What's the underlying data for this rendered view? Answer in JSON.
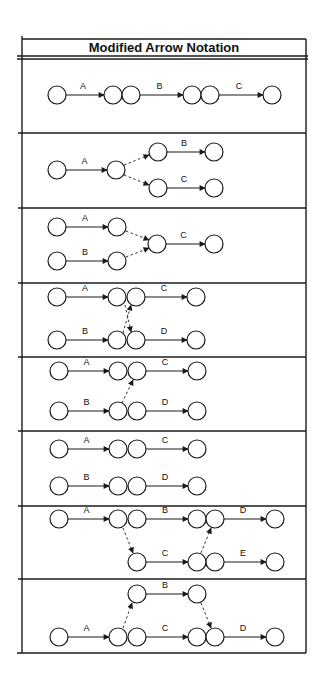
{
  "title": "Modified Arrow Notation",
  "colors": {
    "line": "#1a1a1a",
    "background": "#ffffff"
  },
  "layout": {
    "frame": {
      "left": 22,
      "right": 306,
      "top": 39,
      "bottom": 653,
      "double_line_y": [
        56,
        59
      ]
    },
    "dividers": [
      133,
      208,
      283,
      357,
      431,
      506,
      579
    ],
    "node_radius": 9
  },
  "sections": [
    {
      "name": "sequential-activities",
      "nodes": [
        [
          57,
          95
        ],
        [
          113,
          95
        ],
        [
          131,
          95
        ],
        [
          192,
          95
        ],
        [
          210,
          95
        ],
        [
          272,
          95
        ]
      ],
      "arrows": [
        {
          "from": [
            66,
            95
          ],
          "to": [
            104,
            95
          ],
          "label": "A",
          "type": "activity"
        },
        {
          "from": [
            140,
            95
          ],
          "to": [
            183,
            95
          ],
          "label": "B",
          "type": "activity"
        },
        {
          "from": [
            219,
            95
          ],
          "to": [
            263,
            95
          ],
          "label": "C",
          "type": "activity"
        }
      ]
    },
    {
      "name": "burst-dependency",
      "nodes": [
        [
          57,
          170
        ],
        [
          116,
          170
        ],
        [
          158,
          152
        ],
        [
          214,
          152
        ],
        [
          158,
          188
        ],
        [
          214,
          188
        ]
      ],
      "arrows": [
        {
          "from": [
            66,
            170
          ],
          "to": [
            107,
            170
          ],
          "label": "A",
          "type": "activity"
        },
        {
          "from": [
            124,
            165
          ],
          "to": [
            149,
            155
          ],
          "label": "",
          "type": "dummy"
        },
        {
          "from": [
            124,
            175
          ],
          "to": [
            149,
            185
          ],
          "label": "",
          "type": "dummy"
        },
        {
          "from": [
            167,
            152
          ],
          "to": [
            205,
            152
          ],
          "label": "B",
          "type": "activity"
        },
        {
          "from": [
            167,
            188
          ],
          "to": [
            205,
            188
          ],
          "label": "C",
          "type": "activity"
        }
      ]
    },
    {
      "name": "merge-dependency",
      "nodes": [
        [
          57,
          227
        ],
        [
          117,
          227
        ],
        [
          157,
          244
        ],
        [
          214,
          244
        ],
        [
          57,
          261
        ],
        [
          117,
          261
        ]
      ],
      "arrows": [
        {
          "from": [
            66,
            227
          ],
          "to": [
            108,
            227
          ],
          "label": "A",
          "type": "activity"
        },
        {
          "from": [
            66,
            261
          ],
          "to": [
            108,
            261
          ],
          "label": "B",
          "type": "activity"
        },
        {
          "from": [
            126,
            231
          ],
          "to": [
            149,
            240
          ],
          "label": "",
          "type": "dummy"
        },
        {
          "from": [
            126,
            257
          ],
          "to": [
            149,
            248
          ],
          "label": "",
          "type": "dummy"
        },
        {
          "from": [
            166,
            244
          ],
          "to": [
            205,
            244
          ],
          "label": "C",
          "type": "activity"
        }
      ]
    },
    {
      "name": "cross-dependency",
      "nodes": [
        [
          57,
          297
        ],
        [
          117,
          297
        ],
        [
          136,
          297
        ],
        [
          196,
          297
        ],
        [
          57,
          340
        ],
        [
          117,
          340
        ],
        [
          136,
          340
        ],
        [
          196,
          340
        ]
      ],
      "arrows": [
        {
          "from": [
            66,
            297
          ],
          "to": [
            108,
            297
          ],
          "label": "A",
          "type": "activity"
        },
        {
          "from": [
            145,
            297
          ],
          "to": [
            187,
            297
          ],
          "label": "C",
          "type": "activity"
        },
        {
          "from": [
            66,
            340
          ],
          "to": [
            108,
            340
          ],
          "label": "B",
          "type": "activity"
        },
        {
          "from": [
            145,
            340
          ],
          "to": [
            187,
            340
          ],
          "label": "D",
          "type": "activity"
        },
        {
          "from": [
            123,
            333
          ],
          "to": [
            131,
            305
          ],
          "label": "",
          "type": "dummy"
        },
        {
          "from": [
            125,
            305
          ],
          "to": [
            131,
            332
          ],
          "label": "",
          "type": "dummy"
        }
      ]
    },
    {
      "name": "single-cross-dependency",
      "nodes": [
        [
          59,
          371
        ],
        [
          118,
          371
        ],
        [
          137,
          371
        ],
        [
          197,
          371
        ],
        [
          59,
          411
        ],
        [
          118,
          411
        ],
        [
          137,
          411
        ],
        [
          197,
          411
        ]
      ],
      "arrows": [
        {
          "from": [
            68,
            371
          ],
          "to": [
            109,
            371
          ],
          "label": "A",
          "type": "activity"
        },
        {
          "from": [
            146,
            371
          ],
          "to": [
            188,
            371
          ],
          "label": "C",
          "type": "activity"
        },
        {
          "from": [
            68,
            411
          ],
          "to": [
            109,
            411
          ],
          "label": "B",
          "type": "activity"
        },
        {
          "from": [
            146,
            411
          ],
          "to": [
            188,
            411
          ],
          "label": "D",
          "type": "activity"
        },
        {
          "from": [
            122,
            403
          ],
          "to": [
            133,
            380
          ],
          "label": "",
          "type": "dummy"
        }
      ]
    },
    {
      "name": "independent-chains",
      "nodes": [
        [
          59,
          449
        ],
        [
          118,
          449
        ],
        [
          137,
          449
        ],
        [
          197,
          449
        ],
        [
          59,
          486
        ],
        [
          118,
          486
        ],
        [
          137,
          486
        ],
        [
          197,
          486
        ]
      ],
      "arrows": [
        {
          "from": [
            68,
            449
          ],
          "to": [
            109,
            449
          ],
          "label": "A",
          "type": "activity"
        },
        {
          "from": [
            146,
            449
          ],
          "to": [
            188,
            449
          ],
          "label": "C",
          "type": "activity"
        },
        {
          "from": [
            68,
            486
          ],
          "to": [
            109,
            486
          ],
          "label": "B",
          "type": "activity"
        },
        {
          "from": [
            146,
            486
          ],
          "to": [
            188,
            486
          ],
          "label": "D",
          "type": "activity"
        }
      ]
    },
    {
      "name": "staggered-dependency",
      "nodes": [
        [
          59,
          519
        ],
        [
          118,
          519
        ],
        [
          137,
          519
        ],
        [
          197,
          519
        ],
        [
          215,
          519
        ],
        [
          275,
          519
        ],
        [
          137,
          562
        ],
        [
          197,
          562
        ],
        [
          215,
          562
        ],
        [
          275,
          562
        ]
      ],
      "arrows": [
        {
          "from": [
            68,
            519
          ],
          "to": [
            109,
            519
          ],
          "label": "A",
          "type": "activity"
        },
        {
          "from": [
            146,
            519
          ],
          "to": [
            188,
            519
          ],
          "label": "B",
          "type": "activity"
        },
        {
          "from": [
            224,
            519
          ],
          "to": [
            266,
            519
          ],
          "label": "D",
          "type": "activity"
        },
        {
          "from": [
            123,
            528
          ],
          "to": [
            133,
            553
          ],
          "label": "",
          "type": "dummy"
        },
        {
          "from": [
            146,
            562
          ],
          "to": [
            188,
            562
          ],
          "label": "C",
          "type": "activity"
        },
        {
          "from": [
            224,
            562
          ],
          "to": [
            266,
            562
          ],
          "label": "E",
          "type": "activity"
        },
        {
          "from": [
            201,
            553
          ],
          "to": [
            211,
            528
          ],
          "label": "",
          "type": "dummy"
        }
      ]
    },
    {
      "name": "bypass-dependency",
      "nodes": [
        [
          137,
          594
        ],
        [
          197,
          594
        ],
        [
          59,
          637
        ],
        [
          118,
          637
        ],
        [
          137,
          637
        ],
        [
          197,
          637
        ],
        [
          215,
          637
        ],
        [
          275,
          637
        ]
      ],
      "arrows": [
        {
          "from": [
            146,
            594
          ],
          "to": [
            188,
            594
          ],
          "label": "B",
          "type": "activity"
        },
        {
          "from": [
            68,
            637
          ],
          "to": [
            109,
            637
          ],
          "label": "A",
          "type": "activity"
        },
        {
          "from": [
            123,
            628
          ],
          "to": [
            132,
            603
          ],
          "label": "",
          "type": "dummy"
        },
        {
          "from": [
            146,
            637
          ],
          "to": [
            188,
            637
          ],
          "label": "C",
          "type": "activity"
        },
        {
          "from": [
            201,
            603
          ],
          "to": [
            211,
            628
          ],
          "label": "",
          "type": "dummy"
        },
        {
          "from": [
            224,
            637
          ],
          "to": [
            266,
            637
          ],
          "label": "D",
          "type": "activity"
        }
      ]
    }
  ]
}
